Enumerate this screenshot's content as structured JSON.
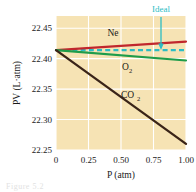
{
  "chart_data": {
    "type": "line",
    "title": "",
    "xlabel": "P (atm)",
    "ylabel": "PV (L·atm)",
    "xlim": [
      0,
      1.0
    ],
    "ylim": [
      22.25,
      22.47
    ],
    "xticks": [
      "0",
      "0.25",
      "0.50",
      "0.75",
      "1.00"
    ],
    "xtick_values": [
      0,
      0.25,
      0.5,
      0.75,
      1.0
    ],
    "yticks": [
      "22.25",
      "22.30",
      "22.35",
      "22.40",
      "22.45"
    ],
    "ytick_values": [
      22.25,
      22.3,
      22.35,
      22.4,
      22.45
    ],
    "grid": true,
    "legend_position": "inline-annotations",
    "plot_background": "#f6e3b4",
    "gridline_color": "#ffffff",
    "series": [
      {
        "name": "Ne",
        "label": "Ne",
        "color": "#c0272d",
        "style": "solid",
        "x": [
          0,
          0.25,
          0.5,
          0.75,
          1.0
        ],
        "values": [
          22.414,
          22.418,
          22.422,
          22.425,
          22.428
        ]
      },
      {
        "name": "Ideal",
        "label": "Ideal",
        "color": "#2bbdc4",
        "style": "dashed",
        "x": [
          0,
          0.25,
          0.5,
          0.75,
          1.0
        ],
        "values": [
          22.414,
          22.414,
          22.414,
          22.414,
          22.414
        ]
      },
      {
        "name": "O2",
        "label": "O",
        "label_sub": "2",
        "color": "#1f9c4a",
        "style": "solid",
        "x": [
          0,
          0.25,
          0.5,
          0.75,
          1.0
        ],
        "values": [
          22.414,
          22.409,
          22.404,
          22.4,
          22.397
        ]
      },
      {
        "name": "CO2",
        "label": "CO",
        "label_sub": "2",
        "color": "#3a2418",
        "style": "solid",
        "x": [
          0,
          0.25,
          0.5,
          0.75,
          1.0
        ],
        "values": [
          22.414,
          22.375,
          22.336,
          22.298,
          22.26
        ]
      }
    ],
    "annotations": [
      {
        "name": "ideal-annotation",
        "text": "Ideal",
        "color": "#2bbdc4",
        "points_to": {
          "x": 0.81,
          "y": 22.414
        }
      }
    ]
  },
  "caption": {
    "ghost_text": "Figure 5.2"
  }
}
